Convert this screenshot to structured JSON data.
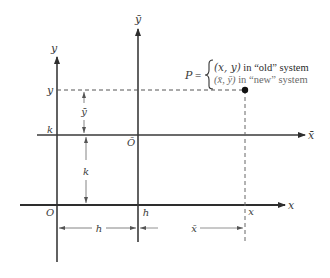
{
  "diagram": {
    "colors": {
      "axis": "#3a3a3a",
      "dashed": "#555555",
      "dimension": "#666666",
      "point": "#111111",
      "new_system_text": "#6a6a6a"
    },
    "axes": {
      "old_x_label": "x",
      "old_y_label": "y",
      "new_x_label": "x̄",
      "new_y_label": "ȳ",
      "old_origin_label": "O",
      "new_origin_label": "Ō"
    },
    "tick_labels": {
      "k_on_y_axis": "k",
      "y_on_y_axis": "y",
      "h_on_x_axis": "h",
      "x_on_x_axis": "x"
    },
    "dimensions": {
      "ybar_label": "ȳ",
      "k_label": "k",
      "h_label": "h",
      "xbar_label": "x̄"
    },
    "point": {
      "name": "P",
      "equals": "=",
      "line1_coords": "(x, y)",
      "line1_text": " in “old” system",
      "line2_coords": "(x̄, ȳ)",
      "line2_text": " in “new” system"
    }
  }
}
